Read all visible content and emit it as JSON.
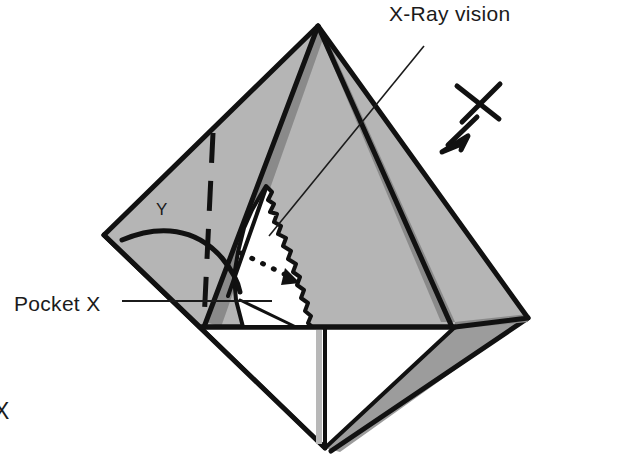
{
  "figure": {
    "kind": "cutaway-pyramid-diagram",
    "background_color": "#ffffff"
  },
  "labels": {
    "xray_vision": "X-Ray vision",
    "pocket_x": "Pocket X",
    "y_marker": "Y",
    "x_cut_off": "X"
  },
  "colors": {
    "outline": "#111111",
    "face_light": "#b5b5b5",
    "face_shadow": "#8a8a8a",
    "face_mid": "#a8a8a8",
    "cavity_fill": "#ffffff",
    "text": "#1b1b1b"
  },
  "annotations": {
    "xray_leader_note": "thin leader line from X-Ray vision text down-left into the cavity",
    "pocket_leader_note": "horizontal leader line from Pocket X text into the white cavity",
    "x_cross_note": "X-shaped cross mark with thick arrow pointing down-left at the right face",
    "dotted_arrow_note": "dotted arrow inside the cavity pointing right and down",
    "dashed_line_note": "vertical dashed line on the left face beside the Y marker",
    "curve_note": "thick curved line sweeping from the left corner toward the cavity"
  },
  "geometry": {
    "apex": [
      318,
      26
    ],
    "left_corner": [
      104,
      235
    ],
    "right_corner": [
      528,
      318
    ],
    "bottom_vertex": [
      325,
      448
    ],
    "base_left": [
      200,
      327
    ],
    "base_right": [
      455,
      327
    ]
  }
}
